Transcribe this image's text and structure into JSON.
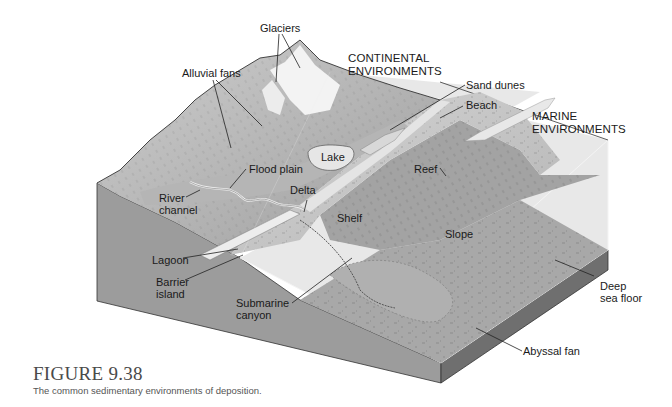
{
  "figure": {
    "number": "FIGURE 9.38",
    "caption": "The common sedimentary environments of deposition."
  },
  "labels": {
    "glaciers": "Glaciers",
    "continental_env": "CONTINENTAL\nENVIRONMENTS",
    "alluvial_fans": "Alluvial fans",
    "sand_dunes": "Sand dunes",
    "beach": "Beach",
    "marine_env": "MARINE\nENVIRONMENTS",
    "lake": "Lake",
    "flood_plain": "Flood plain",
    "delta": "Delta",
    "river_channel": "River\nchannel",
    "reef": "Reef",
    "shelf": "Shelf",
    "slope": "Slope",
    "lagoon": "Lagoon",
    "barrier_island": "Barrier\nisland",
    "submarine_canyon": "Submarine\ncanyon",
    "deep_sea_floor": "Deep\nsea floor",
    "abyssal_fan": "Abyssal fan"
  },
  "colors": {
    "block_side": "#9a9a9a",
    "block_side_dark": "#6e6e6e",
    "land": "#a9a9a9",
    "mountain_light": "#c4c4c4",
    "glacier": "#f2f2f2",
    "shelf": "#c8c8c8",
    "slope": "#a4a4a4",
    "water_face": "#b9b9b9",
    "outline": "#333333"
  }
}
